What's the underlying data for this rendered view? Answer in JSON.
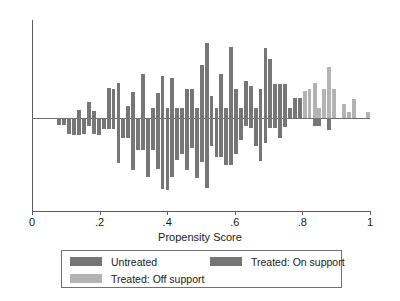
{
  "chart_data": {
    "type": "bar",
    "title": "",
    "subtitle": "",
    "xlabel": "Propensity Score",
    "ylabel": "",
    "xlim": [
      0,
      1
    ],
    "ylim": [
      -1,
      1
    ],
    "grid": false,
    "orientation": "vertical",
    "xticks": [
      0,
      0.2,
      0.4,
      0.6,
      0.8,
      1
    ],
    "xticklabels": [
      "0",
      ".2",
      ".4",
      ".6",
      ".8",
      "1"
    ],
    "yticks": [],
    "yticklabels": [],
    "zero_line": 0,
    "legend": {
      "position": "below-axes",
      "entries": [
        {
          "label": "Untreated",
          "color": "#767676",
          "direction": "down"
        },
        {
          "label": "Treated: On support",
          "color": "#767676",
          "direction": "up"
        },
        {
          "label": "Treated: Off support",
          "color": "#b3b3b3",
          "direction": "up"
        }
      ]
    },
    "colors": {
      "untreated": "#767676",
      "treated_on_support": "#767676",
      "treated_off_support": "#b3b3b3",
      "axis": "#5a5a5a",
      "background": "#ffffff"
    },
    "bin_width": 0.0145,
    "series": [
      {
        "name": "Treated: On support",
        "color": "#767676",
        "direction": "up",
        "points": [
          {
            "x": 0.125,
            "value": 0.0
          },
          {
            "x": 0.14,
            "value": 0.08
          },
          {
            "x": 0.154,
            "value": 0.0
          },
          {
            "x": 0.169,
            "value": 0.16
          },
          {
            "x": 0.183,
            "value": 0.07
          },
          {
            "x": 0.198,
            "value": 0.0
          },
          {
            "x": 0.212,
            "value": 0.0
          },
          {
            "x": 0.227,
            "value": 0.31
          },
          {
            "x": 0.241,
            "value": 0.3
          },
          {
            "x": 0.256,
            "value": 0.36
          },
          {
            "x": 0.27,
            "value": 0.0
          },
          {
            "x": 0.285,
            "value": 0.12
          },
          {
            "x": 0.299,
            "value": 0.27
          },
          {
            "x": 0.314,
            "value": 0.0
          },
          {
            "x": 0.328,
            "value": 0.45
          },
          {
            "x": 0.343,
            "value": 0.0
          },
          {
            "x": 0.357,
            "value": 0.1
          },
          {
            "x": 0.372,
            "value": 0.26
          },
          {
            "x": 0.386,
            "value": 0.43
          },
          {
            "x": 0.401,
            "value": 0.1
          },
          {
            "x": 0.415,
            "value": 0.41
          },
          {
            "x": 0.43,
            "value": 0.1
          },
          {
            "x": 0.444,
            "value": 0.1
          },
          {
            "x": 0.459,
            "value": 0.3
          },
          {
            "x": 0.473,
            "value": 0.3
          },
          {
            "x": 0.488,
            "value": 0.1
          },
          {
            "x": 0.502,
            "value": 0.54
          },
          {
            "x": 0.517,
            "value": 0.77
          },
          {
            "x": 0.531,
            "value": 0.22
          },
          {
            "x": 0.546,
            "value": 0.1
          },
          {
            "x": 0.56,
            "value": 0.45
          },
          {
            "x": 0.575,
            "value": 0.1
          },
          {
            "x": 0.589,
            "value": 0.72
          },
          {
            "x": 0.604,
            "value": 0.3
          },
          {
            "x": 0.618,
            "value": 0.1
          },
          {
            "x": 0.633,
            "value": 0.38
          },
          {
            "x": 0.647,
            "value": 0.33
          },
          {
            "x": 0.662,
            "value": 0.1
          },
          {
            "x": 0.676,
            "value": 0.3
          },
          {
            "x": 0.691,
            "value": 0.71
          },
          {
            "x": 0.705,
            "value": 0.6
          },
          {
            "x": 0.72,
            "value": 0.35
          },
          {
            "x": 0.734,
            "value": 0.35
          },
          {
            "x": 0.749,
            "value": 0.35
          },
          {
            "x": 0.763,
            "value": 0.1
          },
          {
            "x": 0.778,
            "value": 0.2
          },
          {
            "x": 0.792,
            "value": 0.2
          }
        ]
      },
      {
        "name": "Treated: Off support",
        "color": "#b3b3b3",
        "direction": "up",
        "points": [
          {
            "x": 0.807,
            "value": 0.28
          },
          {
            "x": 0.821,
            "value": 0.3
          },
          {
            "x": 0.836,
            "value": 0.36
          },
          {
            "x": 0.85,
            "value": 0.1
          },
          {
            "x": 0.865,
            "value": 0.3
          },
          {
            "x": 0.879,
            "value": 0.52
          },
          {
            "x": 0.894,
            "value": 0.3
          },
          {
            "x": 0.908,
            "value": 0.0
          },
          {
            "x": 0.923,
            "value": 0.14
          },
          {
            "x": 0.937,
            "value": 0.06
          },
          {
            "x": 0.952,
            "value": 0.19
          },
          {
            "x": 0.966,
            "value": 0.0
          },
          {
            "x": 0.981,
            "value": 0.0
          },
          {
            "x": 0.995,
            "value": 0.06
          }
        ]
      },
      {
        "name": "Untreated",
        "color": "#767676",
        "direction": "down",
        "points": [
          {
            "x": 0.081,
            "value": 0.07
          },
          {
            "x": 0.096,
            "value": 0.07
          },
          {
            "x": 0.11,
            "value": 0.17
          },
          {
            "x": 0.125,
            "value": 0.18
          },
          {
            "x": 0.14,
            "value": 0.18
          },
          {
            "x": 0.154,
            "value": 0.17
          },
          {
            "x": 0.169,
            "value": 0.09
          },
          {
            "x": 0.183,
            "value": 0.17
          },
          {
            "x": 0.198,
            "value": 0.18
          },
          {
            "x": 0.212,
            "value": 0.12
          },
          {
            "x": 0.227,
            "value": 0.12
          },
          {
            "x": 0.241,
            "value": 0.12
          },
          {
            "x": 0.256,
            "value": 0.48
          },
          {
            "x": 0.27,
            "value": 0.22
          },
          {
            "x": 0.285,
            "value": 0.22
          },
          {
            "x": 0.299,
            "value": 0.56
          },
          {
            "x": 0.314,
            "value": 0.34
          },
          {
            "x": 0.328,
            "value": 0.34
          },
          {
            "x": 0.343,
            "value": 0.63
          },
          {
            "x": 0.357,
            "value": 0.34
          },
          {
            "x": 0.372,
            "value": 0.55
          },
          {
            "x": 0.386,
            "value": 0.76
          },
          {
            "x": 0.401,
            "value": 0.77
          },
          {
            "x": 0.415,
            "value": 0.63
          },
          {
            "x": 0.43,
            "value": 0.45
          },
          {
            "x": 0.444,
            "value": 0.39
          },
          {
            "x": 0.459,
            "value": 0.56
          },
          {
            "x": 0.473,
            "value": 0.32
          },
          {
            "x": 0.488,
            "value": 0.64
          },
          {
            "x": 0.502,
            "value": 0.47
          },
          {
            "x": 0.517,
            "value": 0.75
          },
          {
            "x": 0.531,
            "value": 0.3
          },
          {
            "x": 0.546,
            "value": 0.42
          },
          {
            "x": 0.56,
            "value": 0.42
          },
          {
            "x": 0.575,
            "value": 0.5
          },
          {
            "x": 0.589,
            "value": 0.5
          },
          {
            "x": 0.604,
            "value": 0.39
          },
          {
            "x": 0.618,
            "value": 0.24
          },
          {
            "x": 0.633,
            "value": 0.09
          },
          {
            "x": 0.647,
            "value": 0.11
          },
          {
            "x": 0.662,
            "value": 0.3
          },
          {
            "x": 0.676,
            "value": 0.46
          },
          {
            "x": 0.691,
            "value": 0.27
          },
          {
            "x": 0.705,
            "value": 0.11
          },
          {
            "x": 0.72,
            "value": 0.11
          },
          {
            "x": 0.734,
            "value": 0.22
          },
          {
            "x": 0.749,
            "value": 0.1
          },
          {
            "x": 0.763,
            "value": 0.0
          },
          {
            "x": 0.778,
            "value": 0.0
          },
          {
            "x": 0.792,
            "value": 0.0
          },
          {
            "x": 0.807,
            "value": 0.0
          },
          {
            "x": 0.821,
            "value": 0.0
          },
          {
            "x": 0.836,
            "value": 0.09
          },
          {
            "x": 0.85,
            "value": 0.09
          },
          {
            "x": 0.865,
            "value": 0.0
          },
          {
            "x": 0.879,
            "value": 0.13
          },
          {
            "x": 0.894,
            "value": 0.0
          }
        ]
      }
    ]
  }
}
